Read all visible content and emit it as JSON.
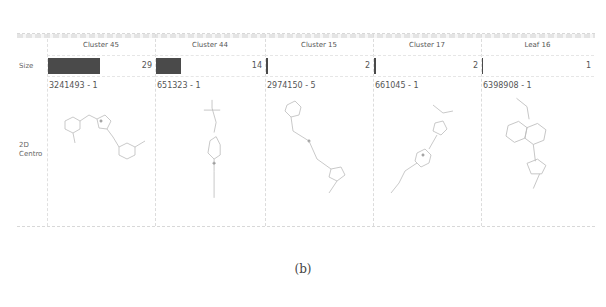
{
  "row_labels": {
    "size": "Size",
    "centroid_line1": "2D",
    "centroid_line2": "Centro"
  },
  "columns": [
    {
      "title": "Cluster 45",
      "size": "29",
      "bar_pct": 100,
      "id_label": "3241493 - 1"
    },
    {
      "title": "Cluster 44",
      "size": "14",
      "bar_pct": 48,
      "id_label": "651323 - 1"
    },
    {
      "title": "Cluster 15",
      "size": "2",
      "bar_pct": 3,
      "id_label": "2974150 - 5"
    },
    {
      "title": "Cluster 17",
      "size": "2",
      "bar_pct": 3,
      "id_label": "661045 - 1"
    },
    {
      "title": "Leaf 16",
      "size": "1",
      "bar_pct": 1.5,
      "id_label": "6398908 - 1"
    }
  ],
  "colors": {
    "bar": "#4a4a4a",
    "grid": "#dcdcdc"
  },
  "caption": "(b)"
}
